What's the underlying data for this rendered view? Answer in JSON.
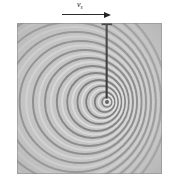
{
  "figure": {
    "kind": "ripple-tank-photograph",
    "background_color": "#ffffff"
  },
  "annotation": {
    "velocity_symbol": "v",
    "velocity_subscript": "s",
    "velocity_label": "vs",
    "arrow_direction": "right",
    "arrow_color": "#2b2b2b"
  },
  "photo": {
    "x": 17,
    "y": 23,
    "width": 145,
    "height": 151,
    "tone_light": "#dcdcdc",
    "tone_mid": "#b4b4b4",
    "tone_dark": "#6d6d6d",
    "border_color": "#8c8c8c",
    "rod_color": "#262626",
    "source_center_x": 90,
    "source_center_y": 79
  },
  "chart_data": {
    "type": "scatter",
    "xlabel": "",
    "ylabel": "",
    "source": {
      "x": 90,
      "y": 79
    },
    "motion_direction": "right",
    "source_speed_label": "vs",
    "wavefront_count": 14,
    "wavefront_radii": [
      5,
      10,
      16,
      22,
      29,
      36,
      44,
      52,
      61,
      70,
      80,
      90,
      101,
      113
    ],
    "wavefront_center_offsets_x": [
      0,
      -2.2,
      -4.8,
      -7.6,
      -10.8,
      -14.2,
      -18.0,
      -22.0,
      -26.4,
      -31.0,
      -36.0,
      -41.2,
      -46.8,
      -52.6
    ],
    "front_spacing_note": "compressed ahead (right)",
    "rear_spacing_note": "expanded behind (left)",
    "grid": false,
    "legend": null
  }
}
